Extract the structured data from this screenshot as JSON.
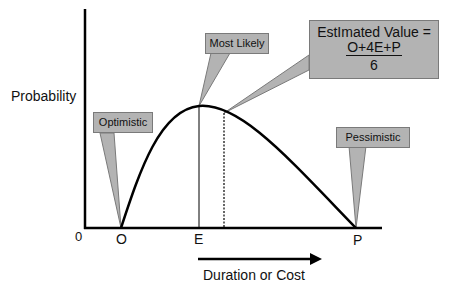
{
  "diagram": {
    "y_axis_label": "Probability",
    "x_axis_label": "Duration or Cost",
    "origin_label": "0",
    "x_ticks": [
      "O",
      "E",
      "P"
    ],
    "callouts": {
      "optimistic": "Optimistic",
      "most_likely": "Most Likely",
      "pessimistic": "Pessimistic",
      "estimated_value_line1": "EstImated Value =",
      "estimated_value_numerator": "O+4E+P",
      "estimated_value_denominator": "6"
    },
    "colors": {
      "callout_fill": "#b3b3b3",
      "callout_border": "#7a7a7a",
      "line": "#000000"
    }
  }
}
